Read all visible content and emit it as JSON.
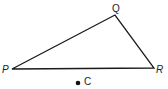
{
  "diagram": {
    "type": "triangle",
    "vertices": [
      {
        "name": "P",
        "x": 12,
        "y": 69
      },
      {
        "name": "Q",
        "x": 115,
        "y": 15
      },
      {
        "name": "R",
        "x": 154,
        "y": 68
      }
    ],
    "point": {
      "name": "C",
      "x": 78,
      "y": 83
    },
    "labels": {
      "P": "P",
      "Q": "Q",
      "R": "R",
      "C": "C"
    },
    "stroke_color": "#1a1a1a"
  }
}
